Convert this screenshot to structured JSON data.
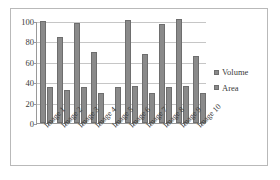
{
  "chart_data": {
    "type": "bar",
    "title": "",
    "xlabel": "",
    "ylabel": "",
    "ylim": [
      0,
      100
    ],
    "yticks": [
      0,
      20,
      40,
      60,
      80,
      100
    ],
    "grid": true,
    "legend_position": "right",
    "categories": [
      "Image 1",
      "Image 2",
      "Image 3",
      "Image 4",
      "Image 5",
      "Image 6",
      "Image 7",
      "Image 8",
      "Image 9",
      "Image 10"
    ],
    "series": [
      {
        "name": "Volume",
        "color": "#8a8a8a",
        "values": [
          100,
          84,
          98,
          70,
          0,
          101,
          68,
          97,
          102,
          66
        ]
      },
      {
        "name": "Area",
        "color": "#8a8a8a",
        "values": [
          35,
          32,
          35,
          29,
          35,
          36,
          29,
          35,
          36,
          29
        ]
      }
    ]
  },
  "legend": {
    "items": [
      {
        "label": "Volume"
      },
      {
        "label": "Area"
      }
    ]
  },
  "colors": {
    "bar_fill": "#8a8a8a",
    "bar_stroke": "#6e6e6e",
    "gridline": "#c6c6c6",
    "axis": "#9a9a9a",
    "frame": "#b9b9b9",
    "text": "#3a3a3a",
    "background": "#ffffff"
  }
}
